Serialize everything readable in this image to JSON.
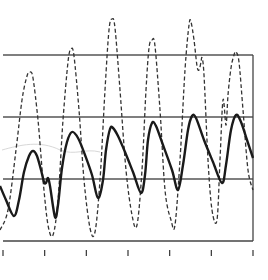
{
  "chart_data": {
    "type": "line",
    "title": "",
    "xlabel": "",
    "ylabel": "",
    "grid": true,
    "legend": null,
    "x_ticks": [
      0,
      1,
      2,
      3,
      4,
      5,
      6
    ],
    "x_tick_labels": [
      "",
      "",
      "",
      "",
      "",
      "",
      ""
    ],
    "y_gridlines_px": [
      55,
      117,
      179
    ],
    "plot_area_px": {
      "left": 0,
      "top": 0,
      "right": 253,
      "bottom": 241
    },
    "series": [
      {
        "name": "dashed upper waveform",
        "style": "dashed",
        "points_px": [
          [
            0,
            230
          ],
          [
            8,
            210
          ],
          [
            16,
            150
          ],
          [
            22,
            100
          ],
          [
            27,
            76
          ],
          [
            30,
            72
          ],
          [
            33,
            78
          ],
          [
            38,
            120
          ],
          [
            43,
            180
          ],
          [
            48,
            225
          ],
          [
            53,
            235
          ],
          [
            58,
            200
          ],
          [
            63,
            120
          ],
          [
            68,
            62
          ],
          [
            71,
            49
          ],
          [
            74,
            56
          ],
          [
            79,
            110
          ],
          [
            84,
            180
          ],
          [
            90,
            228
          ],
          [
            95,
            232
          ],
          [
            100,
            180
          ],
          [
            105,
            90
          ],
          [
            109,
            30
          ],
          [
            112,
            19
          ],
          [
            115,
            28
          ],
          [
            120,
            90
          ],
          [
            126,
            170
          ],
          [
            132,
            215
          ],
          [
            137,
            225
          ],
          [
            142,
            170
          ],
          [
            146,
            90
          ],
          [
            149,
            48
          ],
          [
            152,
            40
          ],
          [
            155,
            46
          ],
          [
            160,
            110
          ],
          [
            165,
            190
          ],
          [
            171,
            220
          ],
          [
            175,
            225
          ],
          [
            180,
            160
          ],
          [
            185,
            70
          ],
          [
            189,
            25
          ],
          [
            191,
            22
          ],
          [
            194,
            40
          ],
          [
            197,
            66
          ],
          [
            199,
            70
          ],
          [
            201,
            62
          ],
          [
            202,
            58
          ],
          [
            204,
            75
          ],
          [
            208,
            160
          ],
          [
            212,
            210
          ],
          [
            217,
            220
          ],
          [
            220,
            160
          ],
          [
            223,
            100
          ],
          [
            226,
            125
          ],
          [
            228,
            95
          ],
          [
            231,
            68
          ],
          [
            234,
            55
          ],
          [
            236,
            52
          ],
          [
            239,
            62
          ],
          [
            243,
            110
          ],
          [
            248,
            170
          ],
          [
            253,
            190
          ]
        ]
      },
      {
        "name": "solid lower waveform",
        "style": "solid",
        "points_px": [
          [
            0,
            186
          ],
          [
            6,
            200
          ],
          [
            14,
            216
          ],
          [
            19,
            200
          ],
          [
            24,
            172
          ],
          [
            29,
            156
          ],
          [
            33,
            151
          ],
          [
            37,
            156
          ],
          [
            41,
            170
          ],
          [
            44,
            182
          ],
          [
            46,
            183
          ],
          [
            48,
            178
          ],
          [
            50,
            186
          ],
          [
            55,
            217
          ],
          [
            58,
            205
          ],
          [
            62,
            168
          ],
          [
            67,
            142
          ],
          [
            72,
            132
          ],
          [
            78,
            138
          ],
          [
            85,
            155
          ],
          [
            92,
            175
          ],
          [
            98,
            198
          ],
          [
            103,
            180
          ],
          [
            106,
            150
          ],
          [
            110,
            129
          ],
          [
            113,
            128
          ],
          [
            118,
            136
          ],
          [
            125,
            152
          ],
          [
            133,
            172
          ],
          [
            141,
            193
          ],
          [
            145,
            175
          ],
          [
            148,
            140
          ],
          [
            152,
            123
          ],
          [
            156,
            126
          ],
          [
            163,
            145
          ],
          [
            172,
            170
          ],
          [
            178,
            190
          ],
          [
            183,
            165
          ],
          [
            188,
            130
          ],
          [
            192,
            116
          ],
          [
            196,
            118
          ],
          [
            204,
            140
          ],
          [
            213,
            162
          ],
          [
            222,
            183
          ],
          [
            226,
            165
          ],
          [
            231,
            130
          ],
          [
            236,
            115
          ],
          [
            241,
            122
          ],
          [
            247,
            140
          ],
          [
            253,
            158
          ]
        ]
      }
    ]
  },
  "figure": {
    "background": "#ffffff",
    "line_color": "#1a1a1a",
    "grid_color": "#555555"
  }
}
